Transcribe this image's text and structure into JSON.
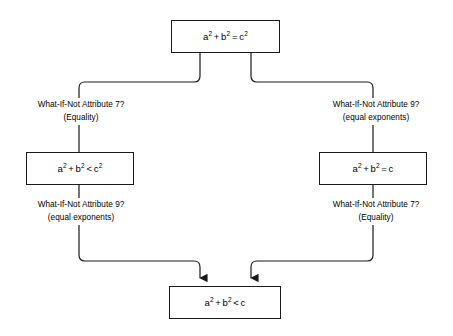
{
  "diagram": {
    "type": "flowchart",
    "orientation": "top-down, two symmetric branches converging",
    "background_color": "#ffffff",
    "line_color": "#1a1a1a",
    "text_color": "#000000"
  },
  "nodes": {
    "top": {
      "id": "node-top",
      "lhs_a": "a",
      "exp_a": "2",
      "plus": "+",
      "lhs_b": "b",
      "exp_b": "2",
      "operator": "=",
      "rhs": "c",
      "exp_c": "2",
      "plain_text": "a2 + b2 = c2"
    },
    "left": {
      "id": "node-left",
      "lhs_a": "a",
      "exp_a": "2",
      "plus": "+",
      "lhs_b": "b",
      "exp_b": "2",
      "operator": "<",
      "rhs": "c",
      "exp_c": "2",
      "plain_text": "a2 + b2 < c2"
    },
    "right": {
      "id": "node-right",
      "lhs_a": "a",
      "exp_a": "2",
      "plus": "+",
      "lhs_b": "b",
      "exp_b": "2",
      "operator": "=",
      "rhs": "c",
      "exp_c": "",
      "plain_text": "a2 + b2 = c"
    },
    "bottom": {
      "id": "node-bottom",
      "lhs_a": "a",
      "exp_a": "2",
      "plus": "+",
      "lhs_b": "b",
      "exp_b": "2",
      "operator": "<",
      "rhs": "c",
      "exp_c": "",
      "plain_text": "a2 + b2 < c"
    }
  },
  "edge_labels": {
    "left_top": {
      "line1": "What-If-Not Attribute 7?",
      "line2": "(Equality)"
    },
    "right_top": {
      "line1": "What-If-Not Attribute 9?",
      "line2": "(equal exponents)"
    },
    "left_bottom": {
      "line1": "What-If-Not Attribute 9?",
      "line2": "(equal exponents)"
    },
    "right_bottom": {
      "line1": "What-If-Not Attribute 7?",
      "line2": "(Equality)"
    }
  },
  "arrowheads": {
    "count": 2,
    "target": "node-bottom",
    "direction": "down",
    "style": "solid filled triangle"
  }
}
